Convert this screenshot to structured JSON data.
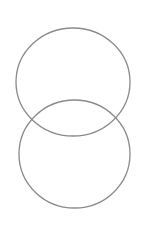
{
  "diagram": {
    "type": "overlapping-circles",
    "background": "#ffffff",
    "stroke_color": "#8a8a8a",
    "stroke_width": 1.3,
    "shapes": [
      {
        "name": "upper-circle",
        "cx": 73,
        "cy": 82,
        "rx": 57,
        "ry": 54
      },
      {
        "name": "lower-circle",
        "cx": 74.5,
        "cy": 154,
        "rx": 55.5,
        "ry": 54
      }
    ]
  }
}
